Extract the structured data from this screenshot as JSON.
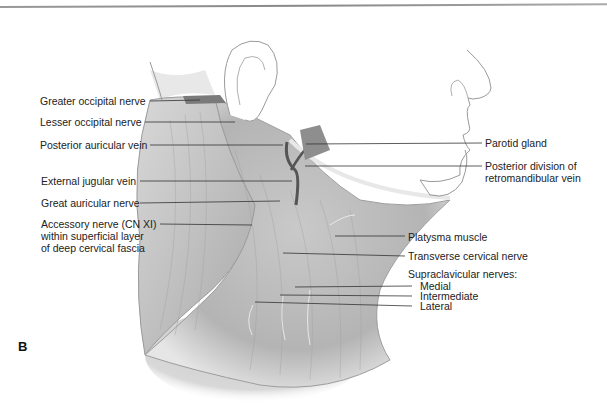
{
  "figure": {
    "panel_label": "B"
  },
  "labels_left": [
    {
      "text": "Greater occipital nerve"
    },
    {
      "text": "Lesser occipital nerve"
    },
    {
      "text": "Posterior auricular vein"
    },
    {
      "text": "External jugular vein"
    },
    {
      "text": "Great auricular nerve"
    },
    {
      "text": "Accessory nerve (CN XI)",
      "line2": "within superficial layer",
      "line3": "of deep cervical fascia"
    }
  ],
  "labels_right": [
    {
      "text": "Parotid gland"
    },
    {
      "text": "Posterior division of",
      "line2": "retromandibular vein"
    },
    {
      "text": "Platysma muscle"
    },
    {
      "text": "Transverse cervical nerve"
    },
    {
      "text": "Supraclavicular nerves:"
    },
    {
      "text": "Medial"
    },
    {
      "text": "Intermediate"
    },
    {
      "text": "Lateral"
    }
  ],
  "colors": {
    "muscle": "#bdbdbd",
    "vein": "#555555",
    "outline": "#9a9a9a",
    "text": "#222222"
  }
}
